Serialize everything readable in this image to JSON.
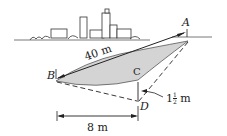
{
  "diagram": {
    "type": "lake-width-measurement",
    "points": {
      "A": "A",
      "B": "B",
      "C": "C",
      "D": "D"
    },
    "labels": {
      "AB": "40 m",
      "CD": "1",
      "CD_frac_num": "1",
      "CD_frac_den": "2",
      "CD_unit": "m",
      "BD_horizontal": "8 m"
    },
    "colors": {
      "ink": "#222222",
      "lake": "#cfcfcf"
    }
  }
}
